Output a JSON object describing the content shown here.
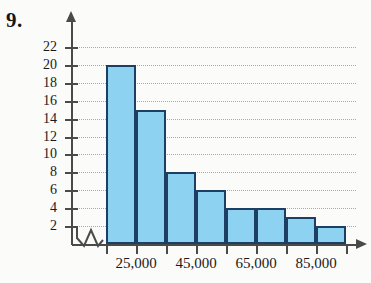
{
  "figure": {
    "problem_number": "9.",
    "colors": {
      "bar_fill": "#8ed2f2",
      "bar_stroke": "#1d3f63",
      "axis": "#4a4a4a",
      "gridline": "#a9a9a9",
      "background": "#fbfbf9"
    }
  },
  "chart_data": {
    "type": "bar",
    "title": "",
    "xlabel": "",
    "ylabel": "",
    "ylim": [
      0,
      23
    ],
    "grid": true,
    "legend": null,
    "axis_break_x": true,
    "y_ticks": [
      2,
      4,
      6,
      8,
      10,
      12,
      14,
      16,
      18,
      20,
      22
    ],
    "y_tick_labels": [
      "2",
      "4",
      "6",
      "8",
      "10",
      "12",
      "14",
      "16",
      "18",
      "20",
      "22"
    ],
    "x_tick_labels": [
      "25,000",
      "45,000",
      "65,000",
      "85,000"
    ],
    "categories": [
      "25,000",
      "35,000",
      "45,000",
      "55,000",
      "65,000",
      "75,000",
      "85,000",
      "95,000"
    ],
    "values": [
      20,
      15,
      8,
      6,
      4,
      4,
      3,
      2
    ]
  }
}
